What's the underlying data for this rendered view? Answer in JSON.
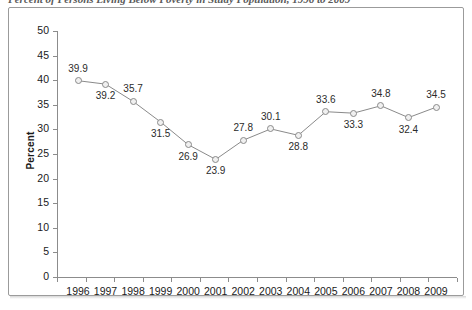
{
  "title": {
    "text": "Percent of Persons Living Below Poverty in Study Population, 1996 to 2009",
    "visible_note": "clipped at top edge"
  },
  "chart_data": {
    "type": "line",
    "title": "Percent of Persons Living Below Poverty in Study Population, 1996 to 2009",
    "xlabel": "",
    "ylabel": "Percent",
    "ylim": [
      0,
      50
    ],
    "ytick_step": 5,
    "grid": false,
    "legend": "none",
    "categories": [
      "1996",
      "1997",
      "1998",
      "1999",
      "2000",
      "2001",
      "2002",
      "2003",
      "2004",
      "2005",
      "2006",
      "2007",
      "2008",
      "2009"
    ],
    "values": [
      39.9,
      39.2,
      35.7,
      31.5,
      26.9,
      23.9,
      27.8,
      30.1,
      28.8,
      33.6,
      33.3,
      34.8,
      32.4,
      34.5
    ],
    "point_labels": [
      "39.9",
      "39.2",
      "35.7",
      "31.5",
      "26.9",
      "23.9",
      "27.8",
      "30.1",
      "28.8",
      "33.6",
      "33.3",
      "34.8",
      "32.4",
      "34.5"
    ],
    "label_positions": [
      "above",
      "below",
      "above",
      "below",
      "below",
      "below",
      "above",
      "above",
      "below",
      "above",
      "below",
      "above",
      "below",
      "above"
    ],
    "yticks": [
      "0",
      "5",
      "10",
      "15",
      "20",
      "25",
      "30",
      "35",
      "40",
      "45",
      "50"
    ],
    "series_color": "#8a8a8a",
    "marker_fill": "#f0f0f0",
    "text_color": "#1a1a1a"
  }
}
